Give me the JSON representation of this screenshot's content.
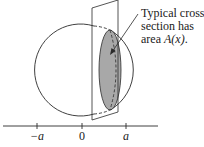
{
  "caption": {
    "line1": "Typical cross",
    "line2": "section has",
    "line3_prefix": "area ",
    "line3_math": "A(x)",
    "line3_suffix": "."
  },
  "axis": {
    "ticks": [
      {
        "label": "−a",
        "x": 37
      },
      {
        "label": "0",
        "x": 82
      },
      {
        "label": "a",
        "x": 126
      }
    ]
  },
  "colors": {
    "stroke": "#2a2a2a",
    "cross_section_fill": "#a8a8a8",
    "background": "#ffffff"
  }
}
